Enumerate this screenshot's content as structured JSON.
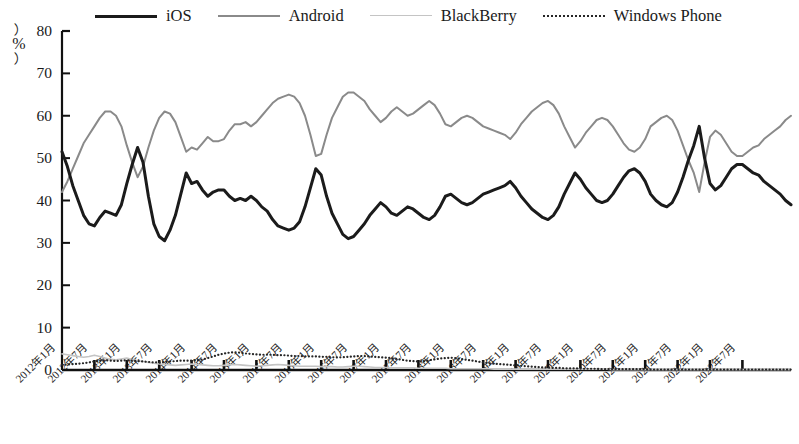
{
  "chart_data": {
    "type": "line",
    "title": "",
    "subtitle": "",
    "xlabel": "",
    "ylabel": "%",
    "ylim": [
      0,
      80
    ],
    "yticks": [
      0,
      10,
      20,
      30,
      40,
      50,
      60,
      70,
      80
    ],
    "grid": false,
    "legend_position": "top",
    "x_tick_labels": [
      "2012年1月",
      "2012年7月",
      "2013年1月",
      "2013年7月",
      "2014年1月",
      "2014年7月",
      "2015年1月",
      "2015年7月",
      "2016年1月",
      "2016年7月",
      "2017年1月",
      "2017年7月",
      "2018年1月",
      "2018年7月",
      "2019年1月",
      "2019年7月",
      "2020年1月",
      "2020年7月",
      "2021年1月",
      "2021年7月",
      "2022年1月",
      "2022年7月"
    ],
    "x_tick_step_months": 6,
    "x_start": "2012-01",
    "x_end": "2022-07",
    "series": [
      {
        "name": "iOS",
        "color": "#1b1b1b",
        "style": "solid",
        "width": 3.0,
        "values": [
          51.5,
          48.0,
          43.5,
          40.0,
          36.5,
          34.5,
          34.0,
          36.0,
          37.5,
          37.0,
          36.5,
          39.0,
          44.0,
          48.5,
          52.5,
          49.0,
          41.0,
          34.5,
          31.5,
          30.5,
          33.0,
          36.5,
          41.5,
          46.5,
          44.0,
          44.5,
          42.5,
          41.0,
          42.0,
          42.5,
          42.5,
          41.0,
          40.0,
          40.5,
          40.0,
          41.0,
          40.0,
          38.5,
          37.5,
          35.5,
          34.0,
          33.5,
          33.0,
          33.5,
          35.0,
          38.5,
          43.0,
          47.5,
          46.0,
          41.0,
          37.0,
          34.5,
          32.0,
          31.0,
          31.5,
          33.0,
          34.5,
          36.5,
          38.0,
          39.5,
          38.5,
          37.0,
          36.5,
          37.5,
          38.5,
          38.0,
          37.0,
          36.0,
          35.5,
          36.5,
          38.5,
          41.0,
          41.5,
          40.5,
          39.5,
          39.0,
          39.5,
          40.5,
          41.5,
          42.0,
          42.5,
          43.0,
          43.5,
          44.5,
          43.0,
          41.0,
          39.5,
          38.0,
          37.0,
          36.0,
          35.5,
          36.5,
          38.5,
          41.5,
          44.0,
          46.5,
          45.0,
          43.0,
          41.5,
          40.0,
          39.5,
          40.0,
          41.5,
          43.5,
          45.5,
          47.0,
          47.5,
          46.5,
          44.5,
          41.5,
          40.0,
          39.0,
          38.5,
          39.5,
          42.0,
          45.5,
          49.5,
          53.0,
          57.5,
          50.0,
          44.0,
          42.5,
          43.5,
          45.5,
          47.5,
          48.5,
          48.5,
          47.5,
          46.5,
          46.0,
          44.5,
          43.5,
          42.5,
          41.5,
          40.0,
          39.0
        ]
      },
      {
        "name": "Android",
        "color": "#8a8a8a",
        "style": "solid",
        "width": 2.0,
        "values": [
          42.0,
          44.5,
          47.5,
          50.5,
          53.5,
          55.5,
          57.5,
          59.5,
          61.0,
          61.0,
          60.0,
          57.5,
          53.0,
          49.0,
          45.5,
          48.0,
          52.5,
          56.5,
          59.5,
          61.0,
          60.5,
          58.5,
          55.0,
          51.5,
          52.5,
          52.0,
          53.5,
          55.0,
          54.0,
          54.0,
          54.5,
          56.5,
          58.0,
          58.0,
          58.5,
          57.5,
          58.5,
          60.0,
          61.5,
          63.0,
          64.0,
          64.5,
          65.0,
          64.5,
          63.0,
          60.0,
          55.5,
          50.5,
          51.0,
          55.5,
          59.5,
          62.0,
          64.5,
          65.5,
          65.5,
          64.5,
          63.5,
          61.5,
          60.0,
          58.5,
          59.5,
          61.0,
          62.0,
          61.0,
          60.0,
          60.5,
          61.5,
          62.5,
          63.5,
          62.5,
          60.5,
          58.0,
          57.5,
          58.5,
          59.5,
          60.0,
          59.5,
          58.5,
          57.5,
          57.0,
          56.5,
          56.0,
          55.5,
          54.5,
          56.0,
          58.0,
          59.5,
          61.0,
          62.0,
          63.0,
          63.5,
          62.5,
          60.5,
          57.5,
          55.0,
          52.5,
          54.0,
          56.0,
          57.5,
          59.0,
          59.5,
          59.0,
          57.5,
          55.5,
          53.5,
          52.0,
          51.5,
          52.5,
          54.5,
          57.5,
          58.5,
          59.5,
          60.0,
          59.0,
          56.5,
          53.0,
          49.5,
          46.5,
          42.0,
          49.0,
          55.0,
          56.5,
          55.5,
          53.5,
          51.5,
          50.5,
          50.5,
          51.5,
          52.5,
          53.0,
          54.5,
          55.5,
          56.5,
          57.5,
          59.0,
          60.0
        ]
      },
      {
        "name": "BlackBerry",
        "color": "#c4c4c4",
        "style": "solid",
        "width": 1.6,
        "values": [
          3.8,
          3.6,
          3.4,
          3.2,
          3.0,
          3.2,
          3.5,
          3.2,
          2.8,
          2.5,
          2.4,
          2.6,
          2.8,
          2.5,
          2.2,
          2.0,
          1.8,
          1.6,
          1.4,
          1.3,
          1.2,
          1.1,
          1.2,
          1.3,
          1.4,
          1.3,
          1.2,
          1.1,
          1.0,
          1.0,
          1.1,
          1.2,
          1.3,
          1.2,
          1.1,
          1.0,
          0.9,
          1.0,
          1.1,
          1.2,
          1.3,
          1.2,
          1.1,
          1.0,
          0.9,
          0.9,
          0.9,
          0.9,
          0.8,
          0.8,
          0.8,
          0.7,
          0.7,
          0.8,
          0.9,
          0.9,
          0.8,
          0.7,
          0.6,
          0.6,
          0.6,
          0.5,
          0.5,
          0.5,
          0.5,
          0.5,
          0.4,
          0.4,
          0.4,
          0.4,
          0.4,
          0.4,
          0.3,
          0.3,
          0.3,
          0.3,
          0.3,
          0.3,
          0.3,
          0.3,
          0.2,
          0.2,
          0.2,
          0.2,
          0.2,
          0.2,
          0.2,
          0.2,
          0.2,
          0.2,
          0.2,
          0.2,
          0.2,
          0.2,
          0.2,
          0.2,
          0.2,
          0.2,
          0.2,
          0.2,
          0.2,
          0.2,
          0.1,
          0.1,
          0.1,
          0.1,
          0.1,
          0.1,
          0.1,
          0.1,
          0.1,
          0.1,
          0.1,
          0.1,
          0.1,
          0.1,
          0.1,
          0.1,
          0.1,
          0.1,
          0.1,
          0.1,
          0.1,
          0.1,
          0.1,
          0.1,
          0.1,
          0.1,
          0.1,
          0.1,
          0.1,
          0.1,
          0.1,
          0.1,
          0.1,
          0.1
        ]
      },
      {
        "name": "Windows Phone",
        "color": "#262626",
        "style": "dotted",
        "width": 2.2,
        "values": [
          1.2,
          1.3,
          1.4,
          1.5,
          1.6,
          1.8,
          2.0,
          2.2,
          2.3,
          2.2,
          2.1,
          2.2,
          2.3,
          2.2,
          2.1,
          2.0,
          1.9,
          1.8,
          1.8,
          1.9,
          2.0,
          2.1,
          2.2,
          2.2,
          2.2,
          2.3,
          2.5,
          2.8,
          3.2,
          3.6,
          3.9,
          4.1,
          4.2,
          4.1,
          3.9,
          3.8,
          3.7,
          3.6,
          3.6,
          3.6,
          3.5,
          3.5,
          3.4,
          3.3,
          3.3,
          3.2,
          3.2,
          3.2,
          3.1,
          3.1,
          3.0,
          3.0,
          3.0,
          3.1,
          3.2,
          3.3,
          3.3,
          3.2,
          3.1,
          3.0,
          2.9,
          2.8,
          2.6,
          2.4,
          2.2,
          2.1,
          2.0,
          2.1,
          2.3,
          2.5,
          2.7,
          2.8,
          2.9,
          2.8,
          2.6,
          2.4,
          2.2,
          2.0,
          1.8,
          1.6,
          1.5,
          1.4,
          1.3,
          1.2,
          1.1,
          1.0,
          0.9,
          0.8,
          0.7,
          0.6,
          0.6,
          0.5,
          0.5,
          0.4,
          0.4,
          0.4,
          0.3,
          0.3,
          0.3,
          0.3,
          0.2,
          0.2,
          0.2,
          0.2,
          0.2,
          0.2,
          0.2,
          0.2,
          0.2,
          0.1,
          0.1,
          0.1,
          0.1,
          0.1,
          0.1,
          0.1,
          0.1,
          0.1,
          0.1,
          0.1,
          0.1,
          0.1,
          0.1,
          0.1,
          0.1,
          0.1,
          0.1,
          0.1,
          0.1,
          0.1,
          0.1,
          0.1,
          0.1,
          0.1,
          0.1,
          0.1
        ]
      }
    ]
  },
  "legend": {
    "items": [
      {
        "label": "iOS",
        "icon": "line-solid-thick-icon"
      },
      {
        "label": "Android",
        "icon": "line-solid-gray-icon"
      },
      {
        "label": "BlackBerry",
        "icon": "line-solid-light-icon"
      },
      {
        "label": "Windows Phone",
        "icon": "line-dotted-icon"
      }
    ]
  },
  "axis": {
    "unit_label": "%",
    "unit_open_paren": "︵",
    "unit_close_paren": "︶"
  }
}
